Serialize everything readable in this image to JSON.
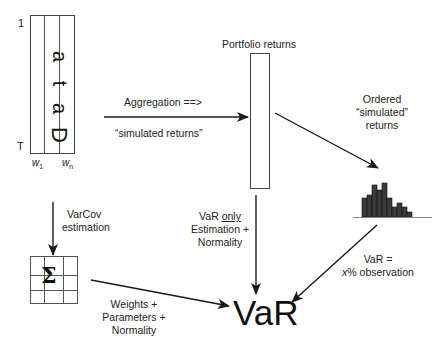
{
  "data_block": {
    "word": "Data",
    "letters": [
      "D",
      "a",
      "t",
      "a"
    ],
    "row_top_label": "1",
    "row_bottom_label": "T",
    "col_labels": [
      {
        "base": "w",
        "sub": "1"
      },
      {
        "base": "w",
        "sub": "n"
      }
    ]
  },
  "aggregation": {
    "label_top": "Aggregation ==>",
    "label_bottom": "“simulated returns”"
  },
  "portfolio": {
    "title": "Portfolio returns"
  },
  "ordered": {
    "lines": [
      "Ordered",
      "“simulated”",
      "returns"
    ]
  },
  "histogram": {
    "bar_heights": [
      19,
      22,
      32,
      27,
      34,
      19,
      10,
      14,
      10,
      5
    ]
  },
  "varcov": {
    "lines": [
      "VarCov",
      "estimation"
    ],
    "symbol": "Σ"
  },
  "var_only": {
    "line1_prefix": "VaR ",
    "line1_underlined": "only",
    "line2": "Estimation +",
    "line3": "Normality"
  },
  "weights": {
    "lines": [
      "Weights +",
      "Parameters +",
      "Normality"
    ]
  },
  "var_obs": {
    "line1": "VaR =",
    "line2_italic": "x",
    "line2_rest": "% observation"
  },
  "result": {
    "label": "VaR"
  },
  "colors": {
    "stroke": "#222222",
    "bar_fill": "#3a3a3a",
    "baseline": "#888888"
  }
}
